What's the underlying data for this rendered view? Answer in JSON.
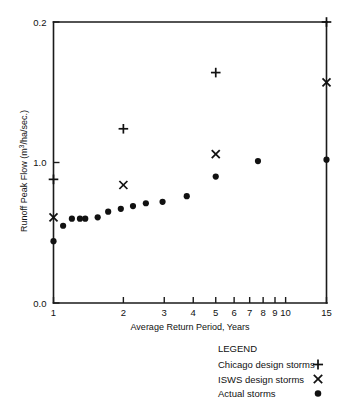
{
  "chart_data": {
    "type": "scatter",
    "title": "",
    "xlabel": "Average Return Period, Years",
    "ylabel": "Runoff Peak Flow (m3/ha/sec.)",
    "ylabel_parts": {
      "pre": "Runoff Peak Flow (m",
      "sup": "3",
      "post": "/ha/sec.)"
    },
    "xscale": "log",
    "xlim": [
      1,
      15
    ],
    "ylim": [
      0.0,
      2.0
    ],
    "grid": false,
    "x_ticks": [
      1,
      2,
      3,
      4,
      5,
      6,
      7,
      8,
      9,
      10,
      15
    ],
    "x_tick_labels": [
      "1",
      "2",
      "3",
      "4",
      "5",
      "6",
      "7",
      "8",
      "9",
      "10",
      "15"
    ],
    "y_ticks": [
      0.0,
      1.0,
      2.0
    ],
    "y_tick_labels": [
      "0.0",
      "1.0",
      "0.2"
    ],
    "legend_position": "below-right",
    "legend_title": "LEGEND",
    "series": [
      {
        "name": "Chicago design storms",
        "marker": "plus",
        "color": "#111111",
        "points": [
          {
            "x": 1,
            "y": 0.88
          },
          {
            "x": 2,
            "y": 1.24
          },
          {
            "x": 5,
            "y": 1.64
          },
          {
            "x": 15,
            "y": 2.0
          }
        ]
      },
      {
        "name": "ISWS design storms",
        "marker": "cross",
        "color": "#111111",
        "points": [
          {
            "x": 1,
            "y": 0.61
          },
          {
            "x": 2,
            "y": 0.84
          },
          {
            "x": 5,
            "y": 1.06
          },
          {
            "x": 15,
            "y": 1.57
          }
        ]
      },
      {
        "name": "Actual storms",
        "marker": "dot",
        "color": "#111111",
        "points": [
          {
            "x": 1.0,
            "y": 0.44
          },
          {
            "x": 1.1,
            "y": 0.55
          },
          {
            "x": 1.2,
            "y": 0.6
          },
          {
            "x": 1.3,
            "y": 0.6
          },
          {
            "x": 1.37,
            "y": 0.6
          },
          {
            "x": 1.55,
            "y": 0.61
          },
          {
            "x": 1.72,
            "y": 0.65
          },
          {
            "x": 1.95,
            "y": 0.67
          },
          {
            "x": 2.2,
            "y": 0.69
          },
          {
            "x": 2.5,
            "y": 0.71
          },
          {
            "x": 2.95,
            "y": 0.72
          },
          {
            "x": 3.75,
            "y": 0.76
          },
          {
            "x": 5.0,
            "y": 0.9
          },
          {
            "x": 7.6,
            "y": 1.01
          },
          {
            "x": 15.0,
            "y": 1.02
          }
        ]
      }
    ]
  },
  "legend": {
    "title": "LEGEND",
    "entries": [
      {
        "label": "Chicago design storms",
        "marker": "plus"
      },
      {
        "label": "ISWS design storms",
        "marker": "cross"
      },
      {
        "label": "Actual storms",
        "marker": "dot"
      }
    ]
  }
}
